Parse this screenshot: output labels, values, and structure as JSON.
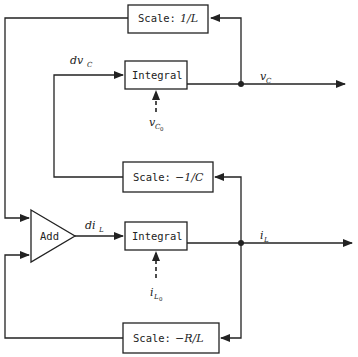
{
  "diagram": {
    "type": "signal-flow block diagram (RLC circuit state model)",
    "blocks": {
      "scale_top": {
        "prefix": "Scale:",
        "value": "1/L"
      },
      "integral_top": {
        "label": "Integral"
      },
      "scale_mid": {
        "prefix": "Scale:",
        "value": "−1/C"
      },
      "add": {
        "label": "Add"
      },
      "integral_bottom": {
        "label": "Integral"
      },
      "scale_bottom": {
        "prefix": "Scale:",
        "value": "−R/L"
      }
    },
    "signals": {
      "dvc": {
        "main": "dv",
        "sub": "C"
      },
      "vc": {
        "main": "v",
        "sub": "C"
      },
      "vc0": {
        "main": "v",
        "sub": "C",
        "subsub": "0"
      },
      "dil": {
        "main": "di",
        "sub": "L"
      },
      "il": {
        "main": "i",
        "sub": "L"
      },
      "il0": {
        "main": "i",
        "sub": "L",
        "subsub": "0"
      }
    },
    "colors": {
      "stroke": "#222222",
      "background": "#ffffff"
    }
  }
}
